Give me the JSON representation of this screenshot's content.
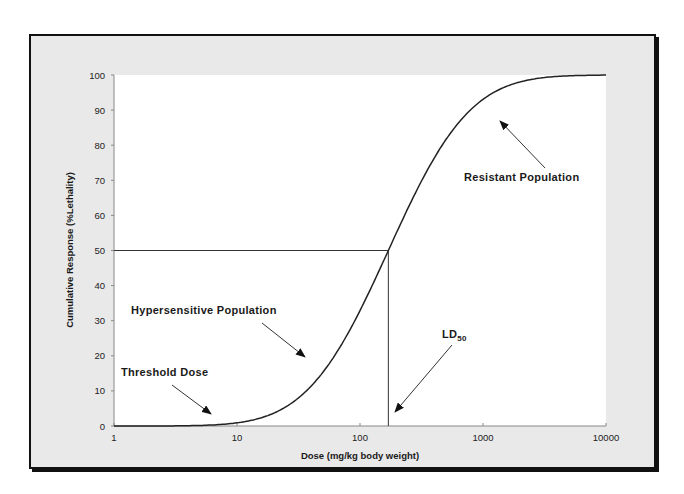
{
  "chart_data": {
    "type": "line",
    "title": "",
    "xlabel": "Dose (mg/kg body weight)",
    "ylabel": "Cumulative Response  (%Lethality)",
    "x_scale": "log",
    "xlim": [
      1,
      10000
    ],
    "ylim": [
      0,
      100
    ],
    "x_ticks": [
      1,
      10,
      100,
      1000,
      10000
    ],
    "x_tick_labels": [
      "1",
      "10",
      "100",
      "1000",
      "10000"
    ],
    "y_ticks": [
      0,
      10,
      20,
      30,
      40,
      50,
      60,
      70,
      80,
      90,
      100
    ],
    "y_tick_labels": [
      "0",
      "10",
      "20",
      "30",
      "40",
      "50",
      "60",
      "70",
      "80",
      "90",
      "100"
    ],
    "grid": false,
    "legend": null,
    "series": [
      {
        "name": "Dose-response curve",
        "x": [
          1,
          2,
          4,
          7,
          10,
          20,
          40,
          70,
          100,
          140,
          170,
          250,
          400,
          700,
          1000,
          2000,
          4000,
          10000
        ],
        "y": [
          0,
          0.1,
          0.4,
          1,
          1.7,
          5,
          13,
          24,
          32,
          43,
          50,
          62,
          76,
          87,
          92,
          97.5,
          99.3,
          100
        ]
      }
    ],
    "reference_lines": {
      "ld50_dose": 170,
      "ld50_response": 50
    },
    "annotations": [
      {
        "text": "Resistant Population",
        "arrow_to": {
          "x": 700,
          "y": 89
        }
      },
      {
        "text": "Hypersensitive Population",
        "arrow_to": {
          "x": 38,
          "y": 11
        }
      },
      {
        "text": "Threshold Dose",
        "arrow_to": {
          "x": 8,
          "y": 0.8
        }
      },
      {
        "text": "LD",
        "subscript": "50",
        "arrow_to": {
          "x": 170,
          "y": 0
        }
      }
    ]
  },
  "labels": {
    "xlabel": "Dose (mg/kg body weight)",
    "ylabel": "Cumulative Response  (%Lethality)",
    "resistant": "Resistant Population",
    "hypersensitive": "Hypersensitive Population",
    "threshold": "Threshold Dose",
    "ld": "LD",
    "ld_sub": "50"
  },
  "colors": {
    "frame_bg": "#e9e9e9",
    "frame_border": "#111111",
    "plot_bg": "#ffffff",
    "curve": "#222222",
    "axis": "#888888"
  }
}
